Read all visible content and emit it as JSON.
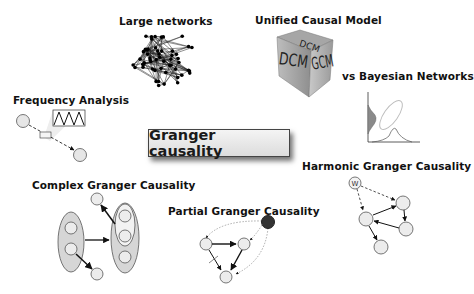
{
  "title": "Granger causality",
  "topics": [
    {
      "id": "large-networks",
      "label": "Large networks"
    },
    {
      "id": "unified-causal-model",
      "label": "Unified Causal Model",
      "cube_faces": [
        "DCM",
        "GCM",
        "DCM"
      ]
    },
    {
      "id": "bayesian",
      "label": "vs Bayesian Networks"
    },
    {
      "id": "frequency",
      "label": "Frequency Analysis"
    },
    {
      "id": "complex",
      "label": "Complex Granger Causality"
    },
    {
      "id": "partial",
      "label": "Partial Granger Causality"
    },
    {
      "id": "harmonic",
      "label": "Harmonic Granger Causality",
      "source_symbol": "W"
    }
  ],
  "colors": {
    "node_fill": "#ececec",
    "node_stroke": "#555555",
    "ellipse_fill": "#d6d6d6",
    "latent_node": "#333333",
    "edge": "#111111"
  }
}
